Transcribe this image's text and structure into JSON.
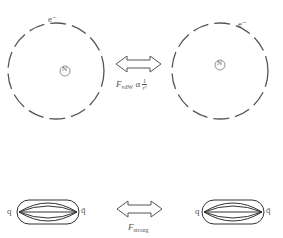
{
  "atoms": {
    "left": {
      "electron_label": "e⁻",
      "nucleus_label": "N"
    },
    "right": {
      "electron_label": "e⁻",
      "nucleus_label": "N"
    }
  },
  "vdw_force": {
    "symbol": "F",
    "subscript": "vdW",
    "relation": "α",
    "fraction_num": "1",
    "fraction_den": "r⁷"
  },
  "mesons": {
    "left": {
      "quark": "q",
      "antiquark": "q̄"
    },
    "right": {
      "quark": "q",
      "antiquark": "q̄"
    }
  },
  "strong_force": {
    "symbol": "F",
    "subscript": "strong"
  },
  "colors": {
    "stroke": "#555555",
    "background": "#ffffff"
  }
}
